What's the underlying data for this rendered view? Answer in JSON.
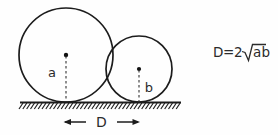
{
  "figure": {
    "background_color": "#fefefe",
    "ink_color": "#1c1c1c",
    "width": 278,
    "height": 135
  },
  "labels": {
    "big_circle_radius": "a",
    "small_circle_radius": "b",
    "distance": "D"
  },
  "formula": {
    "lhs": "D",
    "equals": "=",
    "coefficient": "2",
    "radicand": "ab",
    "full_text": "D = 2√ab"
  },
  "chart_data": {
    "type": "diagram",
    "elements": [
      {
        "name": "large-circle",
        "shape": "circle",
        "center": [
          66,
          55
        ],
        "radius": 47,
        "radius_label": "a",
        "tangent_to_ground": true
      },
      {
        "name": "small-circle",
        "shape": "circle",
        "center": [
          139,
          69
        ],
        "radius": 33,
        "radius_label": "b",
        "tangent_to_ground": true
      },
      {
        "name": "ground-line",
        "shape": "hatched-line",
        "x_start": 20,
        "x_end": 181,
        "y": 102,
        "hatch_count": 42,
        "hatch_direction": "down-left"
      },
      {
        "name": "distance-dimension",
        "shape": "double-arrow",
        "x_start": 64,
        "x_end": 140,
        "y": 122,
        "label": "D",
        "value_expression": "2√ab"
      }
    ],
    "relation": "D = 2√(ab)"
  }
}
